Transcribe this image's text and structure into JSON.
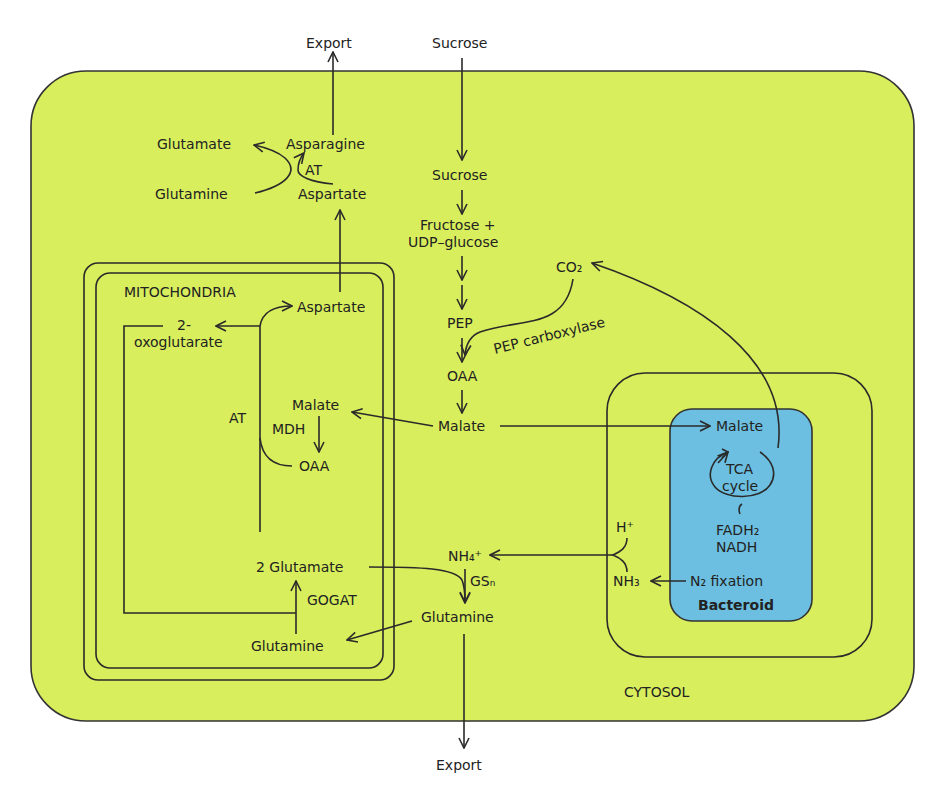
{
  "colors": {
    "cytosol_fill": "#d8ee5c",
    "bacteroid_fill": "#6cbfe0",
    "line": "#2a2a2a",
    "background": "#ffffff"
  },
  "compartments": {
    "cytosol": "CYTOSOL",
    "mitochondria": "MITOCHONDRIA",
    "bacteroid": "Bacteroid"
  },
  "top": {
    "export": "Export",
    "sucrose_in": "Sucrose"
  },
  "asparagine_branch": {
    "glutamate": "Glutamate",
    "glutamine": "Glutamine",
    "asparagine": "Asparagine",
    "aspartate": "Aspartate",
    "enzyme": "AT"
  },
  "glycolysis": {
    "sucrose": "Sucrose",
    "fructose_line1": "Fructose +",
    "fructose_line2": "UDP–glucose",
    "pep": "PEP",
    "oaa": "OAA",
    "malate": "Malate",
    "co2": "CO₂",
    "pep_carboxylase": "PEP carboxylase"
  },
  "mitochondria": {
    "aspartate": "Aspartate",
    "oxoglutarate_line1": "2-",
    "oxoglutarate_line2": "oxoglutarate",
    "at": "AT",
    "malate": "Malate",
    "mdh": "MDH",
    "oaa": "OAA",
    "glutamate": "2 Glutamate",
    "gogat": "GOGAT",
    "glutamine": "Glutamine"
  },
  "ammonium": {
    "nh4": "NH₄⁺",
    "gs": "GSₙ",
    "glutamine": "Glutamine",
    "export": "Export",
    "h_plus": "H⁺",
    "nh3": "NH₃"
  },
  "bacteroid": {
    "malate": "Malate",
    "tca_line1": "TCA",
    "tca_line2": "cycle",
    "fadh2": "FADH₂",
    "nadh": "NADH",
    "n2_fixation": "N₂  fixation"
  }
}
